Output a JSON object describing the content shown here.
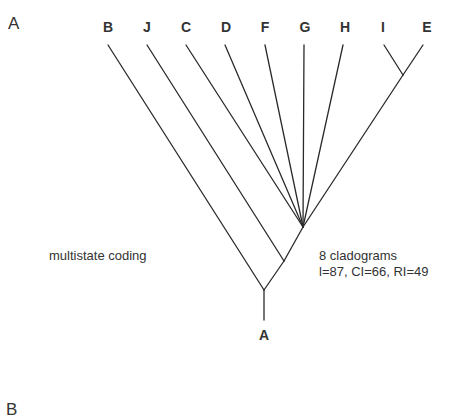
{
  "panel_a": {
    "label": "A",
    "tips": [
      {
        "name": "B",
        "x": 108
      },
      {
        "name": "J",
        "x": 147
      },
      {
        "name": "C",
        "x": 186
      },
      {
        "name": "D",
        "x": 225
      },
      {
        "name": "F",
        "x": 265
      },
      {
        "name": "G",
        "x": 304
      },
      {
        "name": "H",
        "x": 343
      },
      {
        "name": "I",
        "x": 384
      },
      {
        "name": "E",
        "x": 423
      }
    ],
    "root_label": "A",
    "coding_label": "multistate coding",
    "result_line1": "8 cladograms",
    "result_line2": "l=87, CI=66, RI=49"
  },
  "panel_b": {
    "label": "B"
  }
}
